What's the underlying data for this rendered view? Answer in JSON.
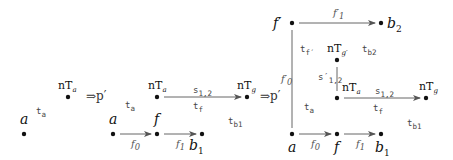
{
  "panels": [
    {
      "nodes": {
        "a": "a",
        "nTa": "nT",
        "nTa_sub": "a"
      },
      "edge_labels": {
        "ta": "t",
        "ta_sub": "a"
      }
    },
    {
      "nodes": {
        "a": "a",
        "f": "f",
        "b1": "b",
        "b1_sub": "1",
        "nTa": "nT",
        "nTa_sub": "a",
        "nTg": "nT",
        "nTg_sub": "g"
      },
      "edge_labels": {
        "f0": "f",
        "f0_sub": "0",
        "f1": "f",
        "f1_sub": "1",
        "s12": "s",
        "s12_sub": "1,2",
        "ta": "t",
        "ta_sub": "a",
        "tf": "t",
        "tf_sub": "f",
        "tb1": "t",
        "tb1_sub": "b1"
      }
    },
    {
      "nodes": {
        "fprime": "f′",
        "b2": "b",
        "b2_sub": "2",
        "nTgprime": "nT",
        "nTgprime_sub": "g′",
        "nTa": "nT",
        "nTa_sub": "a",
        "nTg": "nT",
        "nTg_sub": "g",
        "a": "a",
        "f": "f",
        "b1": "b",
        "b1_sub": "1"
      },
      "edge_labels": {
        "f1prime": "f′",
        "f1prime_sub": "1",
        "f0prime": "f′",
        "f0prime_sub": "0",
        "tfprime": "t",
        "tfprime_sub": "f′",
        "tb2": "t",
        "tb2_sub": "b2",
        "s12prime": "s′",
        "s12prime_sub": "1,2",
        "s12": "s",
        "s12_sub": "1,2",
        "ta": "t",
        "ta_sub": "a",
        "tf": "t",
        "tf_sub": "f",
        "tb1": "t",
        "tb1_sub": "b1",
        "f0": "f",
        "f0_sub": "0",
        "f1": "f",
        "f1_sub": "1"
      }
    }
  ],
  "transitions": [
    "⇒p′",
    "⇒p′"
  ]
}
